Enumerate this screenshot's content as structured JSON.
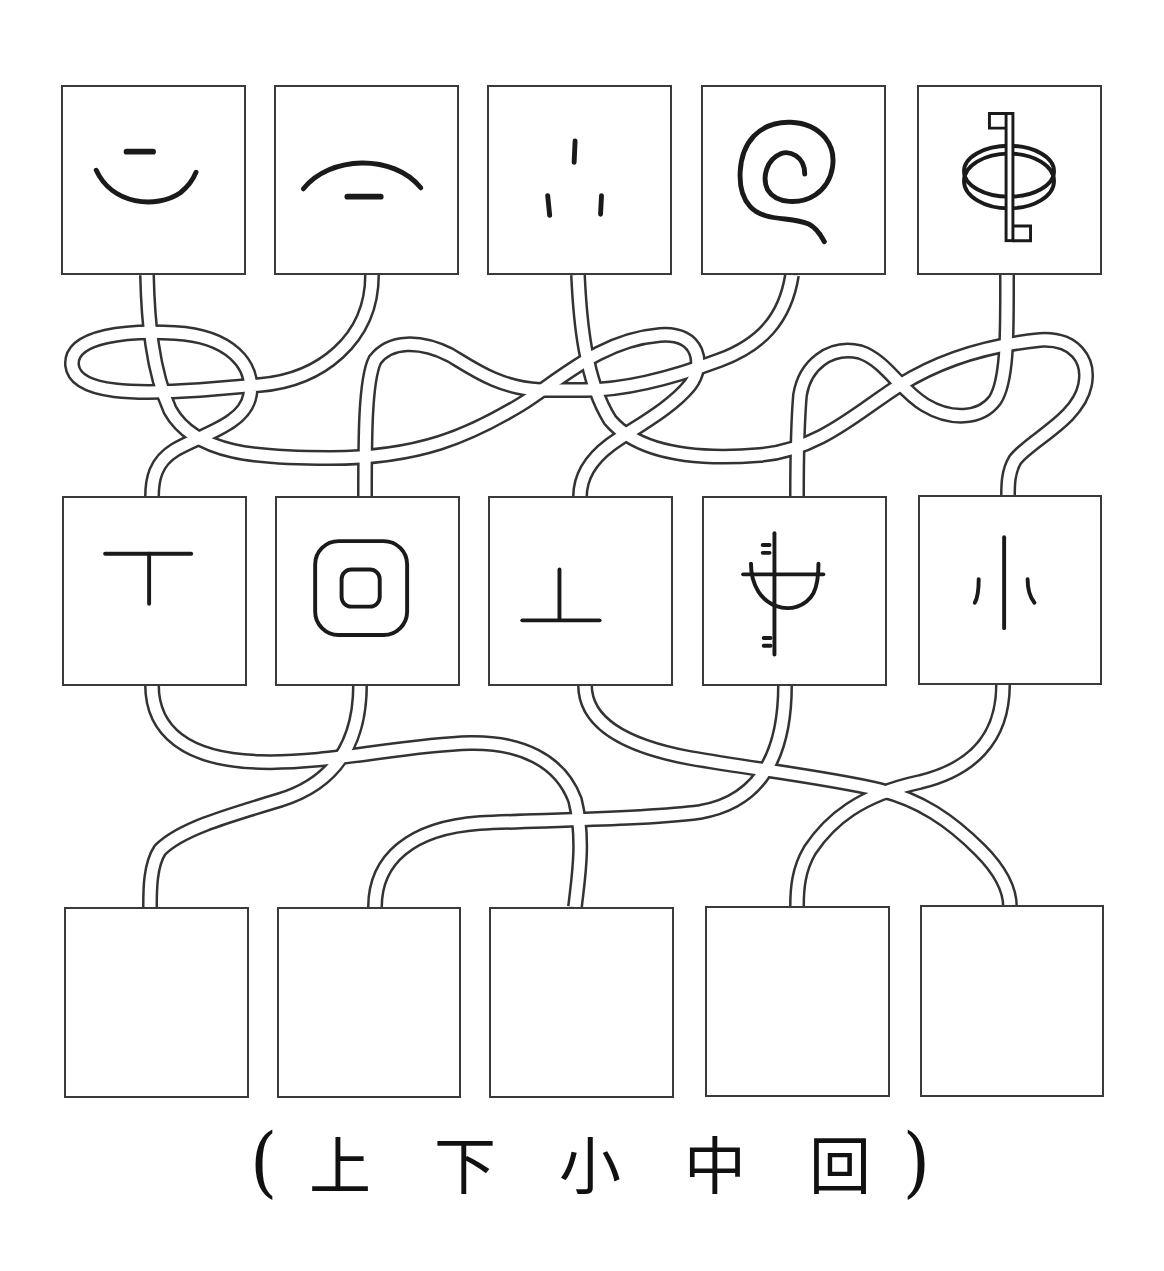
{
  "diagram": {
    "type": "matching-maze",
    "top_row": [
      {
        "id": "T1",
        "glyph": "ancient-shang-up-arc",
        "meaning": "上 (ancient form: short stroke above arc)"
      },
      {
        "id": "T2",
        "glyph": "ancient-xia-down-arc",
        "meaning": "下 (ancient form: arc above short stroke)"
      },
      {
        "id": "T3",
        "glyph": "ancient-xiao-three-dots",
        "meaning": "小 (ancient form: three short strokes)"
      },
      {
        "id": "T4",
        "glyph": "ancient-hui-spiral",
        "meaning": "回 (ancient form: spiral)"
      },
      {
        "id": "T5",
        "glyph": "ancient-zhong-flag-ring",
        "meaning": "中 (ancient form: pole through ellipse with flags)"
      }
    ],
    "middle_row": [
      {
        "id": "M1",
        "glyph": "bronze-xia-T",
        "meaning": "下 (seal form)"
      },
      {
        "id": "M2",
        "glyph": "bronze-hui-nested-squares",
        "meaning": "回 (seal form)"
      },
      {
        "id": "M3",
        "glyph": "bronze-shang-inverted-T",
        "meaning": "上 (seal form)"
      },
      {
        "id": "M4",
        "glyph": "bronze-zhong-flagpole-bowl",
        "meaning": "中 (seal form)"
      },
      {
        "id": "M5",
        "glyph": "bronze-xiao-three-strokes",
        "meaning": "小 (seal form)"
      }
    ],
    "bottom_row": [
      {
        "id": "B1",
        "value": ""
      },
      {
        "id": "B2",
        "value": ""
      },
      {
        "id": "B3",
        "value": ""
      },
      {
        "id": "B4",
        "value": ""
      },
      {
        "id": "B5",
        "value": ""
      }
    ]
  },
  "answer_options": {
    "open_paren": "(",
    "close_paren": ")",
    "options": [
      "上",
      "下",
      "小",
      "中",
      "回"
    ]
  },
  "colors": {
    "line": "#333333",
    "glyph": "#1a1a1a",
    "background": "#ffffff"
  }
}
